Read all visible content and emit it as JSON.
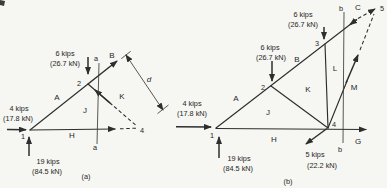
{
  "panels": {
    "a": {
      "caption": "(a)",
      "section_label": "a",
      "dimension_label": "d",
      "nodes": {
        "n1": "1",
        "n2": "2",
        "n4": "4"
      },
      "regions": {
        "A": "A",
        "B": "B",
        "J": "J",
        "K": "K",
        "H": "H"
      },
      "forces": {
        "top_load": {
          "kips": "6 kips",
          "kn": "(26.7 kN)"
        },
        "horiz_load": {
          "kips": "4 kips",
          "kn": "(17.8 kN)"
        },
        "vert_reaction": {
          "kips": "19 kips",
          "kn": "(84.5 kN)"
        }
      }
    },
    "b": {
      "caption": "(b)",
      "section_label": "b",
      "nodes": {
        "n1": "1",
        "n2": "2",
        "n3": "3",
        "n4": "4",
        "n5": "5"
      },
      "regions": {
        "A": "A",
        "B": "B",
        "C": "C",
        "J": "J",
        "K": "K",
        "L": "L",
        "M": "M",
        "H": "H",
        "G": "G"
      },
      "forces": {
        "load_at_2": {
          "kips": "6 kips",
          "kn": "(26.7 kN)"
        },
        "load_at_3": {
          "kips": "6 kips",
          "kn": "(26.7 kN)"
        },
        "horiz_load": {
          "kips": "4 kips",
          "kn": "(17.8 kN)"
        },
        "vert_reaction": {
          "kips": "19 kips",
          "kn": "(84.5 kN)"
        },
        "load_at_4": {
          "kips": "5 kips",
          "kn": "(22.2 kN)"
        }
      }
    }
  },
  "colors": {
    "ink": "#2e2e2e",
    "paper": "#f6f6f2"
  }
}
